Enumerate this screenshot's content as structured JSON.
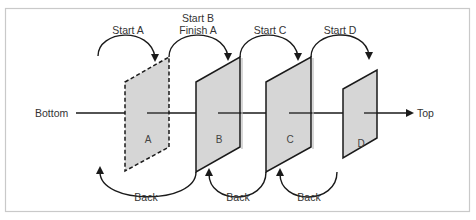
{
  "diagram": {
    "axis": {
      "left_label": "Bottom",
      "right_label": "Top"
    },
    "panels": [
      {
        "id": "A",
        "label": "A",
        "style": "dashed"
      },
      {
        "id": "B",
        "label": "B",
        "style": "solid"
      },
      {
        "id": "C",
        "label": "C",
        "style": "solid"
      },
      {
        "id": "D",
        "label": "D",
        "style": "solid"
      }
    ],
    "forward_arrows": [
      {
        "label_line1": "Start A",
        "label_line2": ""
      },
      {
        "label_line1": "Start B",
        "label_line2": "Finish A"
      },
      {
        "label_line1": "Start C",
        "label_line2": ""
      },
      {
        "label_line1": "Start D",
        "label_line2": ""
      }
    ],
    "back_arrows": [
      {
        "label": "Back"
      },
      {
        "label": "Back"
      },
      {
        "label": "Back"
      }
    ],
    "colors": {
      "panel_fill": "#d6d6d6",
      "stroke": "#1a1a1a",
      "frame": "#c9c9c9",
      "text": "#333333"
    }
  }
}
